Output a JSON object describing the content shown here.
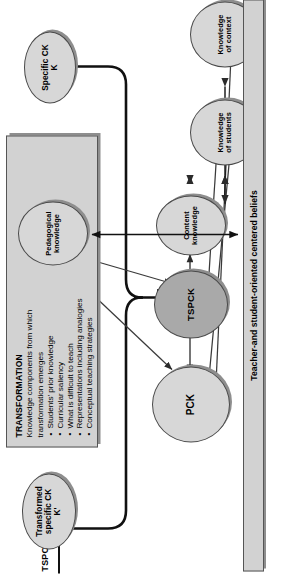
{
  "figure": {
    "title_label": "TSPCK",
    "orientation": "rotated-90-ccw",
    "colors": {
      "node_fill_light": "#d7d7d7",
      "node_fill_dark": "#a9a9a9",
      "box_fill": "#d2d2d2",
      "outline": "#4a4a4a",
      "shadow": "#8e8e8e"
    }
  },
  "top_row": {
    "left_node": {
      "line1": "Transformed",
      "line2": "specific CK",
      "line3": "K'"
    },
    "right_node": {
      "line1": "Specific CK",
      "line2": "K"
    }
  },
  "transformation_box": {
    "title": "TRANSFORMATION",
    "lead_line1": "Knowledge components from which",
    "lead_line2": "transformation emerges",
    "bullets": [
      "Students' prior knowledge",
      "Curricular saliency",
      "What is difficult to teach",
      "Representations including analogies",
      "Conceptual teaching strategies"
    ]
  },
  "core_nodes": {
    "pck": "PCK",
    "tspck": "TSPCK"
  },
  "knowledge_nodes": [
    {
      "line1": "Pedagogical",
      "line2": "knowledge"
    },
    {
      "line1": "Content",
      "line2": "knowledge"
    },
    {
      "line1": "Knowledge",
      "line2": "of students"
    },
    {
      "line1": "Knowledge",
      "line2": "of context"
    }
  ],
  "beliefs_bar": {
    "label": "Teacher-and student-oriented centered beliefs"
  }
}
